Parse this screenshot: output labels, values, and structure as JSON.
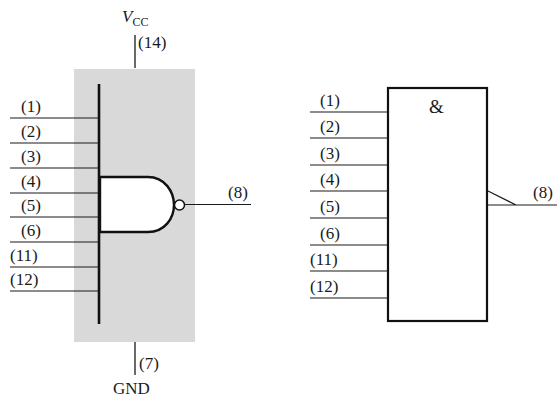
{
  "left_symbol": {
    "supply": {
      "name": "V",
      "subscript": "CC",
      "pin": "(14)"
    },
    "ground": {
      "pin": "(7)",
      "name": "GND"
    },
    "inputs": [
      "(1)",
      "(2)",
      "(3)",
      "(4)",
      "(5)",
      "(6)",
      "(11)",
      "(12)"
    ],
    "output": "(8)",
    "gate_type": "NAND",
    "package_fill": "#d9d9d9"
  },
  "right_symbol": {
    "function_label": "&",
    "inputs": [
      "(1)",
      "(2)",
      "(3)",
      "(4)",
      "(5)",
      "(6)",
      "(11)",
      "(12)"
    ],
    "output": "(8)"
  }
}
